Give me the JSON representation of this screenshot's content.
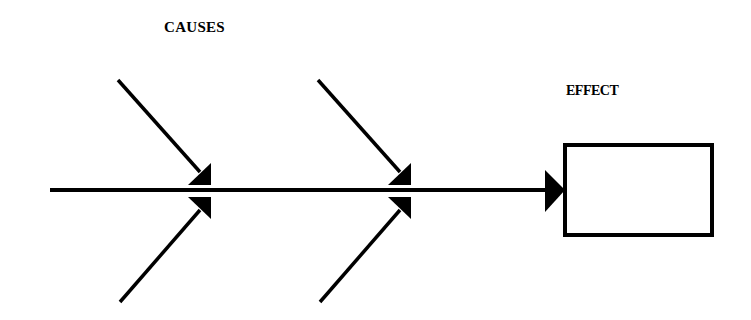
{
  "diagram": {
    "type": "fishbone",
    "labels": {
      "causes": "CAUSES",
      "effect": "EFFECT"
    },
    "colors": {
      "line": "#000000",
      "background": "#ffffff",
      "box_fill": "#ffffff"
    },
    "spine": {
      "x1": 50,
      "y": 190,
      "x2": 548
    },
    "effect_box": {
      "x": 565,
      "y": 145,
      "w": 147,
      "h": 90,
      "text": ""
    },
    "branches": [
      {
        "id": "cause-1-top",
        "x1": 118,
        "y1": 80,
        "x2": 210,
        "y2": 185
      },
      {
        "id": "cause-1-bottom",
        "x1": 120,
        "y1": 302,
        "x2": 210,
        "y2": 195
      },
      {
        "id": "cause-2-top",
        "x1": 318,
        "y1": 80,
        "x2": 410,
        "y2": 185
      },
      {
        "id": "cause-2-bottom",
        "x1": 320,
        "y1": 302,
        "x2": 410,
        "y2": 195
      }
    ]
  }
}
